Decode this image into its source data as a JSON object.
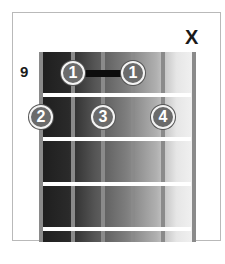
{
  "chord_diagram": {
    "starting_fret_label": "9",
    "muted_marker": "X",
    "muted_string": 6,
    "strings_x": [
      41,
      73,
      103,
      133,
      163,
      194
    ],
    "frets_y": [
      95,
      139,
      184,
      229
    ],
    "barre": {
      "from_string": 2,
      "to_string": 4,
      "fret": 1,
      "label": ""
    },
    "dots": [
      {
        "finger": "1",
        "string": 2,
        "fret": 1,
        "x": 73,
        "y": 73
      },
      {
        "finger": "1",
        "string": 4,
        "fret": 1,
        "x": 133,
        "y": 73
      },
      {
        "finger": "2",
        "string": 1,
        "fret": 2,
        "x": 41,
        "y": 117
      },
      {
        "finger": "3",
        "string": 3,
        "fret": 2,
        "x": 103,
        "y": 117
      },
      {
        "finger": "4",
        "string": 5,
        "fret": 2,
        "x": 163,
        "y": 117
      }
    ],
    "colors": {
      "dot_fill": "#6b6b6b",
      "dot_ring": "#f4f4f4",
      "fret": "#ffffff",
      "string": "#8a8a8a",
      "barre": "#0d0d0d"
    }
  }
}
